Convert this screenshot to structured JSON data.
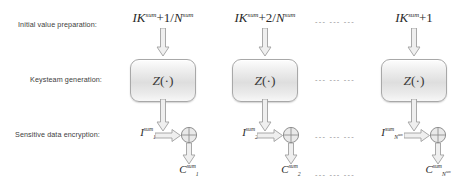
{
  "diagram": {
    "type": "block-diagram",
    "row_labels": [
      "Initial value preparation:",
      "Keysteam generation:",
      "Sensitive data encryption:"
    ],
    "ellipsis": "--- --- ---",
    "columns": [
      {
        "id": "col-1",
        "initial_value": {
          "base": "IK",
          "base_sup": "sum",
          "operator": "+",
          "numerator": "1",
          "slash": "/",
          "denominator": "N",
          "denominator_sup": "sum"
        },
        "keystream_block": {
          "label": "Z",
          "arg": "(·)"
        },
        "plaintext": {
          "base": "I",
          "sup": "sum",
          "sub": "1"
        },
        "ciphertext": {
          "base": "C",
          "sup": "sum",
          "sub": "1"
        }
      },
      {
        "id": "col-2",
        "initial_value": {
          "base": "IK",
          "base_sup": "sum",
          "operator": "+",
          "numerator": "2",
          "slash": "/",
          "denominator": "N",
          "denominator_sup": "sum"
        },
        "keystream_block": {
          "label": "Z",
          "arg": "(·)"
        },
        "plaintext": {
          "base": "I",
          "sup": "sum",
          "sub": "2"
        },
        "ciphertext": {
          "base": "C",
          "sup": "sum",
          "sub": "2"
        }
      },
      {
        "id": "col-n",
        "initial_value": {
          "base": "IK",
          "base_sup": "sum",
          "operator": "+",
          "numerator": "1",
          "slash": "",
          "denominator": "",
          "denominator_sup": ""
        },
        "keystream_block": {
          "label": "Z",
          "arg": "(·)"
        },
        "plaintext": {
          "base": "I",
          "sup": "sum",
          "sub": "N",
          "sub_sup": "sum"
        },
        "ciphertext": {
          "base": "C",
          "sup": "sum",
          "sub": "N",
          "sub_sup": "sum"
        }
      }
    ],
    "colors": {
      "background": "#ffffff",
      "text": "#2a2a2a",
      "label_text": "#3d3d3d",
      "stroke": "#a0a0a0",
      "block_fill": "#e6e6e6",
      "ellipsis": "#8d8d8d"
    }
  }
}
